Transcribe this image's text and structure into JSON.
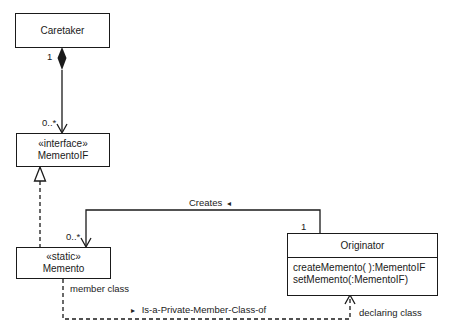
{
  "diagram": {
    "type": "UML class diagram",
    "pattern": "Memento",
    "classes": {
      "caretaker": {
        "name": "Caretaker"
      },
      "memento_if": {
        "stereotype": "«interface»",
        "name": "MementoIF"
      },
      "memento": {
        "stereotype": "«static»",
        "name": "Memento"
      },
      "originator": {
        "name": "Originator",
        "operations": [
          "createMemento( ):MementoIF",
          "setMemento(:MementoIF)"
        ]
      }
    },
    "relationships": {
      "caretaker_mementoif": {
        "kind": "composition",
        "source_multiplicity": "1",
        "target_multiplicity": "0..*"
      },
      "memento_realizes_mementoif": {
        "kind": "realization"
      },
      "creates": {
        "kind": "association",
        "label": "Creates",
        "direction_glyph": "◂",
        "source_multiplicity": "1",
        "target_multiplicity": "0..*"
      },
      "private_member": {
        "kind": "dependency",
        "label": "Is-a-Private-Member-Class-of",
        "direction_glyph": "▸",
        "source_role": "member class",
        "target_role": "declaring class"
      }
    }
  },
  "colors": {
    "line": "#1a1a1a",
    "background": "#ffffff"
  }
}
